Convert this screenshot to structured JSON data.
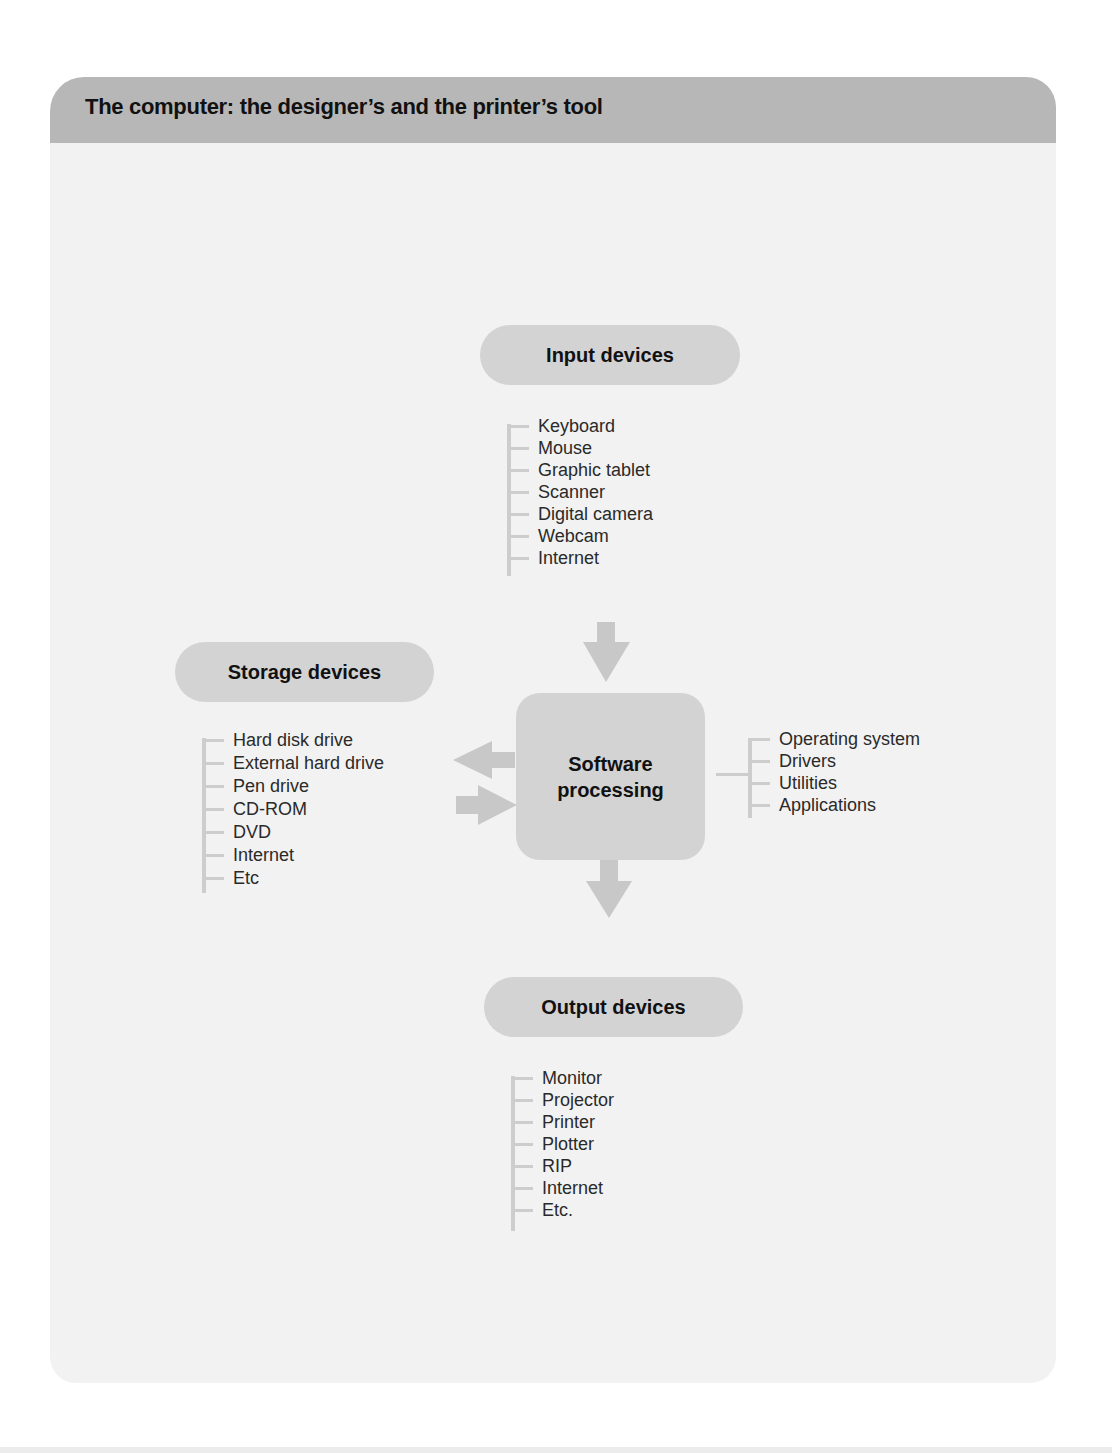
{
  "header": {
    "title": "The computer: the designer’s and the printer’s tool"
  },
  "diagram": {
    "input": {
      "label": "Input devices",
      "items": [
        "Keyboard",
        "Mouse",
        "Graphic tablet",
        "Scanner",
        "Digital camera",
        "Webcam",
        "Internet"
      ]
    },
    "storage": {
      "label": "Storage devices",
      "items": [
        "Hard disk drive",
        "External hard drive",
        "Pen drive",
        "CD-ROM",
        "DVD",
        "Internet",
        "Etc"
      ]
    },
    "processing": {
      "label_line1": "Software",
      "label_line2": "processing",
      "items": [
        "Operating system",
        "Drivers",
        "Utilities",
        "Applications"
      ]
    },
    "output": {
      "label": "Output devices",
      "items": [
        "Monitor",
        "Projector",
        "Printer",
        "Plotter",
        "RIP",
        "Internet",
        "Etc."
      ]
    },
    "colors": {
      "header": "#b7b7b7",
      "panel": "#f2f2f2",
      "node": "#d3d3d3",
      "arrow": "#c8c8c8",
      "bracket": "#cdcdcd"
    }
  }
}
